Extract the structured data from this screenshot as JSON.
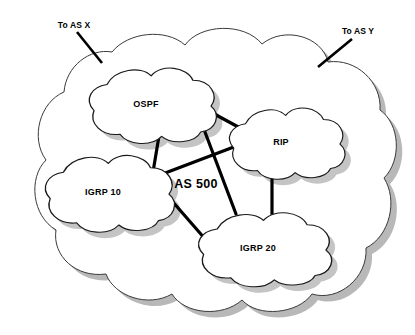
{
  "diagram": {
    "title": "AS 500",
    "outer_domain": {
      "label": "AS 500",
      "label_x": 196,
      "label_y": 184
    },
    "nodes": [
      {
        "id": "ospf",
        "label": "OSPF",
        "cx": 146,
        "cy": 104,
        "rx": 52,
        "ry": 36
      },
      {
        "id": "rip",
        "label": "RIP",
        "cx": 281,
        "cy": 142,
        "rx": 48,
        "ry": 34
      },
      {
        "id": "igrp10",
        "label": "IGRP 10",
        "cx": 103,
        "cy": 192,
        "rx": 53,
        "ry": 37
      },
      {
        "id": "igrp20",
        "label": "IGRP 20",
        "cx": 258,
        "cy": 248,
        "rx": 55,
        "ry": 36
      }
    ],
    "links": [
      {
        "id": "ospf-rip",
        "from": "ospf",
        "to": "rip",
        "x1": 194,
        "y1": 103,
        "x2": 242,
        "y2": 129
      },
      {
        "id": "ospf-igrp20",
        "from": "ospf",
        "to": "igrp20",
        "x1": 194,
        "y1": 103,
        "x2": 236,
        "y2": 214
      },
      {
        "id": "ospf-igrp10",
        "from": "ospf",
        "to": "igrp10",
        "x1": 159,
        "y1": 136,
        "x2": 152,
        "y2": 178
      },
      {
        "id": "igrp10-rip",
        "from": "igrp10",
        "to": "rip",
        "x1": 152,
        "y1": 178,
        "x2": 239,
        "y2": 145
      },
      {
        "id": "igrp10-igrp20",
        "from": "igrp10",
        "to": "igrp20",
        "x1": 152,
        "y1": 178,
        "x2": 206,
        "y2": 240
      },
      {
        "id": "rip-igrp20",
        "from": "rip",
        "to": "igrp20",
        "x1": 272,
        "y1": 178,
        "x2": 272,
        "y2": 214
      }
    ],
    "external_links": [
      {
        "id": "to-as-x",
        "label": "To AS X",
        "label_x": 74,
        "label_y": 25,
        "x1": 77,
        "y1": 32,
        "x2": 102,
        "y2": 63
      },
      {
        "id": "to-as-y",
        "label": "To AS Y",
        "label_x": 358,
        "label_y": 31,
        "x1": 352,
        "y1": 39,
        "x2": 318,
        "y2": 67
      }
    ],
    "colors": {
      "background": "#ffffff",
      "cloud_fill": "#ffffff",
      "cloud_stroke": "#1a1a1a",
      "outer_cloud_stroke": "#3a3a3a",
      "shadow": "#c4c4c4",
      "outer_shadow": "#b8b8b8",
      "link": "#000000",
      "text": "#000000"
    }
  }
}
